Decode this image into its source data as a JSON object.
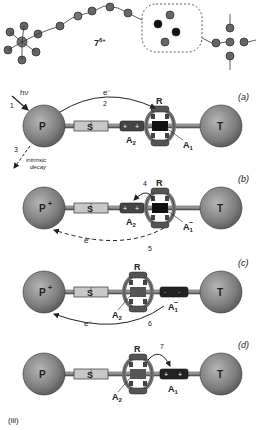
{
  "figure": {
    "compound_label": "7",
    "compound_charge": "6+",
    "part_label": "(iii)"
  },
  "panels": [
    {
      "id": "a",
      "label": "(a)",
      "photosensitizer": "P",
      "photosensitizer_charge": "",
      "spacer": "S",
      "station2": "A",
      "station2_sub": "2",
      "ring": "R",
      "station1": "A",
      "station1_sub": "1",
      "station1_charge": "",
      "stopper": "T",
      "light": "hν",
      "step_light": "1",
      "electron": "e⁻",
      "step_electron": "2",
      "step_decay": "3",
      "decay_label_1": "intrinsic",
      "decay_label_2": "decay"
    },
    {
      "id": "b",
      "label": "(b)",
      "photosensitizer": "P",
      "photosensitizer_charge": "+",
      "spacer": "S",
      "station2": "A",
      "station2_sub": "2",
      "ring": "R",
      "station1": "A",
      "station1_sub": "1",
      "station1_charge": "−",
      "stopper": "T",
      "step_shuttle": "4",
      "electron": "e⁻",
      "step_back": "5"
    },
    {
      "id": "c",
      "label": "(c)",
      "photosensitizer": "P",
      "photosensitizer_charge": "+",
      "spacer": "S",
      "station2": "A",
      "station2_sub": "2",
      "ring": "R",
      "station1": "A",
      "station1_sub": "1",
      "station1_charge": "−",
      "stopper": "T",
      "electron": "e⁻",
      "step_back": "6"
    },
    {
      "id": "d",
      "label": "(d)",
      "photosensitizer": "P",
      "photosensitizer_charge": "",
      "spacer": "S",
      "station2": "A",
      "station2_sub": "2",
      "ring": "R",
      "station1": "A",
      "station1_sub": "1",
      "station1_charge": "",
      "stopper": "T",
      "step_return": "7"
    }
  ],
  "colors": {
    "sphere": "#8a8a8a",
    "sphere_dark": "#555555",
    "station_dark": "#333333",
    "spacer_light": "#c8c8c8",
    "ring": "#9a9a9a",
    "ink": "#222222"
  }
}
